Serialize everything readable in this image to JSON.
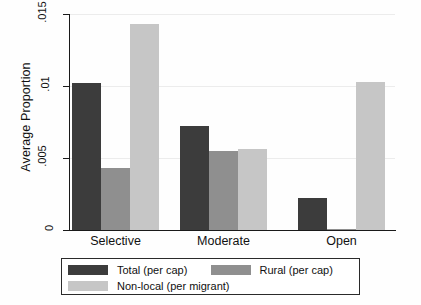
{
  "chart_data": {
    "type": "bar",
    "title": "",
    "subtitle": "",
    "xlabel": "",
    "ylabel": "Average Proportion",
    "categories": [
      "Selective",
      "Moderate",
      "Open"
    ],
    "series": [
      {
        "name": "Total (per cap)",
        "color": "#3c3c3c",
        "values": [
          0.0102,
          0.0072,
          0.0022
        ]
      },
      {
        "name": "Rural (per cap)",
        "color": "#8f8f8f",
        "values": [
          0.0043,
          0.0055,
          0.0001
        ]
      },
      {
        "name": "Non-local (per migrant)",
        "color": "#c6c6c6",
        "values": [
          0.0143,
          0.0056,
          0.0103
        ]
      }
    ],
    "ylim": [
      0,
      0.015
    ],
    "yticks": [
      0,
      0.005,
      0.01,
      0.015
    ],
    "ytick_labels": [
      "0",
      ".005",
      ".01",
      ".015"
    ],
    "grid": true,
    "grid_axis": "y",
    "legend_position": "bottom",
    "legend_entries": [
      "Total (per cap)",
      "Rural (per cap)",
      "Non-local (per migrant)"
    ]
  },
  "legend": {
    "row1_left": "Total (per cap)",
    "row1_right": "Rural (per cap)",
    "row2_left": "Non-local (per migrant)"
  }
}
